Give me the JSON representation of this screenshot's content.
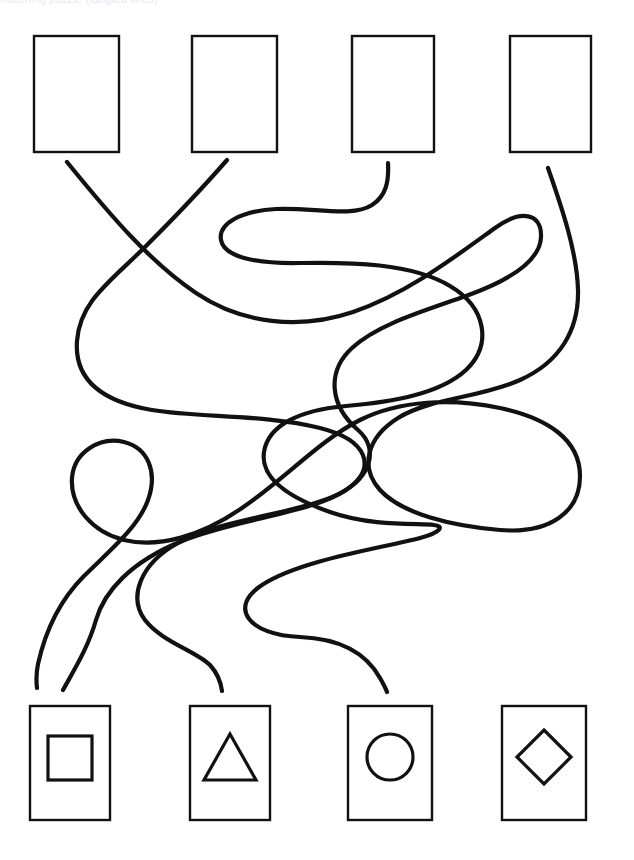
{
  "page": {
    "width": 634,
    "height": 860,
    "background_color": "#ffffff",
    "ink_color": "#111111",
    "cropped_header_text": "matching puzzle (tangled lines)"
  },
  "top_row": {
    "label": "Top row of empty answer boxes",
    "boxes": [
      {
        "id": "top-box-1",
        "content": "",
        "shape": "empty",
        "x": 34,
        "y": 36,
        "width": 85,
        "height": 116
      },
      {
        "id": "top-box-2",
        "content": "",
        "shape": "empty",
        "x": 192,
        "y": 36,
        "width": 85,
        "height": 116
      },
      {
        "id": "top-box-3",
        "content": "",
        "shape": "empty",
        "x": 352,
        "y": 36,
        "width": 82,
        "height": 116
      },
      {
        "id": "top-box-4",
        "content": "",
        "shape": "empty",
        "x": 510,
        "y": 36,
        "width": 81,
        "height": 116
      }
    ]
  },
  "bottom_row": {
    "label": "Bottom row of shape boxes",
    "boxes": [
      {
        "id": "bottom-box-1",
        "shape": "square",
        "shape_label": "Square",
        "x": 30,
        "y": 706,
        "width": 80,
        "height": 114
      },
      {
        "id": "bottom-box-2",
        "shape": "triangle",
        "shape_label": "Triangle",
        "x": 190,
        "y": 706,
        "width": 80,
        "height": 114
      },
      {
        "id": "bottom-box-3",
        "shape": "circle",
        "shape_label": "Circle",
        "x": 348,
        "y": 706,
        "width": 84,
        "height": 114
      },
      {
        "id": "bottom-box-4",
        "shape": "diamond",
        "shape_label": "Diamond",
        "x": 502,
        "y": 706,
        "width": 84,
        "height": 114
      }
    ]
  },
  "paths": {
    "label": "Four tangled connector lines",
    "stroke_width": 4.2,
    "lines": [
      {
        "id": "line-1",
        "name": "path-from-top-box-1",
        "start": {
          "x": 67,
          "y": 162
        },
        "end": {
          "x": 222,
          "y": 691
        },
        "d": "M 67 162 C 110 215 150 262 196 293 C 242 324 300 330 353 312 C 406 294 452 259 495 228 C 521 209 542 213 541 237 C 540 262 508 281 466 296 C 424 311 378 324 352 348 C 326 372 330 406 358 430 C 380 449 372 481 330 498 C 288 515 222 519 178 543 C 140 564 128 597 145 620 C 162 642 196 651 210 665 C 219 675 221 683 222 691"
      },
      {
        "id": "line-2",
        "name": "path-from-top-box-2",
        "start": {
          "x": 227,
          "y": 160
        },
        "end": {
          "x": 63,
          "y": 690
        },
        "d": "M 227 160 C 200 191 172 220 146 246 C 110 282 80 301 77 341 C 74 382 105 402 152 410 C 200 418 265 414 320 428 C 368 440 378 468 346 490 C 312 513 236 519 182 541 C 130 562 104 592 96 620 C 88 648 74 670 63 690"
      },
      {
        "id": "line-3",
        "name": "path-from-top-box-3",
        "start": {
          "x": 388,
          "y": 163
        },
        "end": {
          "x": 387,
          "y": 692
        },
        "d": "M 388 163 C 389 182 386 196 372 205 C 352 218 312 207 276 209 C 240 211 218 224 221 240 C 224 257 256 264 300 263 C 350 262 412 263 450 286 C 487 308 492 345 466 370 C 440 394 392 402 346 406 C 300 410 268 425 264 452 C 260 479 290 498 330 512 C 372 527 420 523 434 525 C 444 526 442 532 420 538 C 382 548 300 560 262 585 C 228 607 248 635 300 637 C 350 639 370 660 380 678 C 384 685 386 689 387 692"
      },
      {
        "id": "line-4",
        "name": "path-from-top-box-4",
        "start": {
          "x": 548,
          "y": 168
        },
        "end": {
          "x": 536,
          "y": 692
        },
        "d": "M 548 168 C 562 208 577 252 578 290 C 579 330 560 362 520 380 C 480 398 430 398 398 418 C 366 438 360 468 380 490 C 402 514 452 526 500 530 C 550 534 580 512 580 476 C 580 440 548 418 500 408 C 452 398 400 400 360 420 C 320 440 286 478 242 508 C 200 537 158 548 124 540 C 92 532 70 506 72 478 C 74 452 100 436 124 442 C 148 448 158 472 148 500 C 138 528 108 552 84 576 C 62 598 46 628 38 664 C 36 674 36 680 37 688"
      }
    ]
  }
}
